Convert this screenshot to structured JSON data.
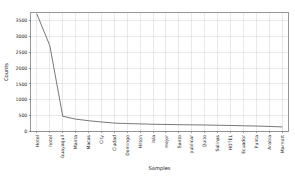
{
  "chart_data": {
    "type": "line",
    "title": "",
    "xlabel": "Samples",
    "ylabel": "Counts",
    "grid": true,
    "legend": false,
    "ylim": [
      0,
      3750
    ],
    "yticks": [
      0,
      500,
      1000,
      1500,
      2000,
      2500,
      3000,
      3500
    ],
    "ytick_labels": [
      "0",
      "500",
      "1000",
      "1500",
      "2000",
      "2500",
      "3000",
      "3500"
    ],
    "categories": [
      "Hotel",
      "hotel",
      "Guayaquil",
      "Manta",
      "Macas",
      "City",
      "Ciudad",
      "Domingo",
      "Hilton",
      "Isla",
      "mejor",
      "Santo",
      "publicar",
      "Quito",
      "Salinas",
      "HOTEL",
      "Ecuador",
      "Punta",
      "Arabia",
      "Marriott"
    ],
    "values": [
      3700,
      2700,
      480,
      390,
      340,
      300,
      265,
      250,
      240,
      228,
      222,
      215,
      210,
      205,
      198,
      190,
      180,
      172,
      160,
      145
    ],
    "series": [
      {
        "name": "counts",
        "values": [
          3700,
          2700,
          480,
          390,
          340,
          300,
          265,
          250,
          240,
          228,
          222,
          215,
          210,
          205,
          198,
          190,
          180,
          172,
          160,
          145
        ]
      }
    ]
  },
  "colors": {
    "line": "#555555",
    "grid": "#c8c8d2",
    "frame": "#6b6b6b",
    "text": "#1a1a1a",
    "background": "#ffffff"
  }
}
